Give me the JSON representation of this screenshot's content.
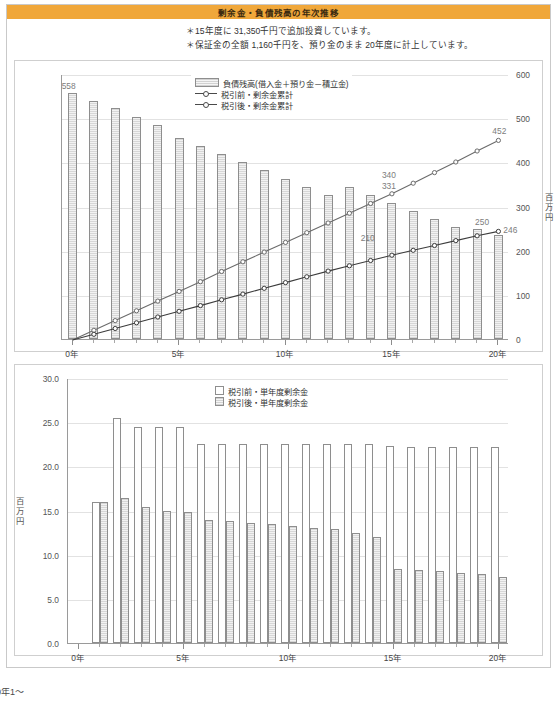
{
  "header": {
    "title": "剰余金・負債残高の年次推移",
    "band_color": "#f0a73a"
  },
  "notes": [
    {
      "bullet": "＊",
      "text": "15年度に 31,350千円で追加投資しています。"
    },
    {
      "bullet": "＊",
      "text": "保証金の全額 1,160千円を、預り金のまま 20年度に計上しています。"
    }
  ],
  "footer": {
    "cut_text": "0年1～"
  },
  "chart_data": [
    {
      "id": "top",
      "type": "bar",
      "title": "",
      "xlabel": "",
      "ylabel": "百万円",
      "ylim": [
        0,
        600
      ],
      "yticks": [
        "0",
        "100",
        "200",
        "300",
        "400",
        "500",
        "600"
      ],
      "xticks": [
        "0年",
        "5年",
        "10年",
        "15年",
        "20年"
      ],
      "xtick_positions": [
        0,
        5,
        10,
        15,
        20
      ],
      "x": [
        0,
        1,
        2,
        3,
        4,
        5,
        6,
        7,
        8,
        9,
        10,
        11,
        12,
        13,
        14,
        15,
        16,
        17,
        18,
        19,
        20
      ],
      "grid": true,
      "legend_position": "top-center",
      "series": [
        {
          "name": "負債残高(借入金＋預り金－積立金)",
          "kind": "bar",
          "values": [
            558,
            540,
            522,
            503,
            485,
            455,
            437,
            418,
            400,
            382,
            363,
            345,
            327,
            345,
            327,
            308,
            290,
            272,
            253,
            250,
            235
          ]
        },
        {
          "name": "税引前・剰余金累計",
          "kind": "line",
          "values": [
            0,
            22,
            44,
            66,
            88,
            110,
            132,
            155,
            177,
            199,
            221,
            243,
            265,
            287,
            309,
            331,
            355,
            379,
            403,
            428,
            452
          ]
        },
        {
          "name": "税引後・剰余金累計",
          "kind": "line",
          "values": [
            0,
            13,
            26,
            39,
            52,
            65,
            78,
            91,
            104,
            117,
            130,
            143,
            156,
            168,
            180,
            192,
            203,
            214,
            225,
            236,
            246
          ]
        }
      ],
      "annotations": [
        {
          "text": "558",
          "x": 0,
          "value": 558,
          "series": "負債残高(借入金＋預り金－積立金)"
        },
        {
          "text": "452",
          "x": 20,
          "value": 452,
          "series": "税引前・剰余金累計"
        },
        {
          "text": "340",
          "x": 15,
          "value": 340,
          "series": "税引前・剰余金累計"
        },
        {
          "text": "331",
          "x": 15,
          "value": 331,
          "series": "税引前・剰余金累計"
        },
        {
          "text": "250",
          "x": 19,
          "value": 250,
          "series": "負債残高(借入金＋預り金－積立金)"
        },
        {
          "text": "246",
          "x": 20,
          "value": 246,
          "series": "税引後・剰余金累計"
        },
        {
          "text": "210",
          "x": 14,
          "value": 210,
          "series": "税引後・剰余金累計"
        }
      ]
    },
    {
      "id": "bottom",
      "type": "bar",
      "title": "",
      "xlabel": "",
      "ylabel": "百万円",
      "ylim": [
        0,
        30
      ],
      "yticks": [
        "0.0",
        "5.0",
        "10.0",
        "15.0",
        "20.0",
        "25.0",
        "30.0"
      ],
      "xticks": [
        "0年",
        "5年",
        "10年",
        "15年",
        "20年"
      ],
      "xtick_positions": [
        0,
        5,
        10,
        15,
        20
      ],
      "x": [
        0,
        1,
        2,
        3,
        4,
        5,
        6,
        7,
        8,
        9,
        10,
        11,
        12,
        13,
        14,
        15,
        16,
        17,
        18,
        19,
        20
      ],
      "grid": true,
      "legend_position": "top-center",
      "series": [
        {
          "name": "税引前・単年度剰余金",
          "kind": "bar",
          "values": [
            0.0,
            16.0,
            25.5,
            24.5,
            24.4,
            24.4,
            22.5,
            22.5,
            22.5,
            22.5,
            22.5,
            22.5,
            22.5,
            22.5,
            22.5,
            22.3,
            22.2,
            22.2,
            22.2,
            22.2,
            22.2
          ]
        },
        {
          "name": "税引後・単年度剰余金",
          "kind": "bar",
          "values": [
            0.0,
            16.0,
            16.4,
            15.4,
            15.0,
            14.8,
            13.9,
            13.8,
            13.6,
            13.5,
            13.3,
            13.0,
            12.9,
            12.5,
            12.0,
            8.4,
            8.3,
            8.1,
            7.9,
            7.8,
            7.5
          ]
        }
      ],
      "annotations": []
    }
  ]
}
